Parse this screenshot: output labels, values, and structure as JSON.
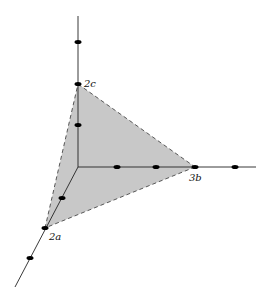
{
  "diagram": {
    "colors": {
      "plane_fill": "#c8c8c8",
      "axis": "#222222",
      "dot": "#000000",
      "dash": "#333333"
    },
    "labels": {
      "c_intercept": "2c",
      "b_intercept": "3b",
      "a_intercept": "2a"
    }
  }
}
